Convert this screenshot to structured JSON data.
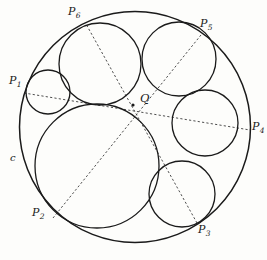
{
  "figure": {
    "background_color": "#fdfdfb",
    "stroke_color": "#1a1a1a",
    "dash_color": "#3a3a3a",
    "outer_circle": {
      "name": "c",
      "cx": 135,
      "cy": 127,
      "r": 115.5
    },
    "inner_circles": [
      {
        "name": "circle-1-small-left",
        "cx": 48,
        "cy": 92,
        "r": 22
      },
      {
        "name": "circle-2-large-bottom",
        "cx": 97,
        "cy": 166,
        "r": 62
      },
      {
        "name": "circle-3-bottom-right",
        "cx": 182,
        "cy": 194,
        "r": 33
      },
      {
        "name": "circle-4-right",
        "cx": 205,
        "cy": 123,
        "r": 33
      },
      {
        "name": "circle-5-top-right",
        "cx": 179,
        "cy": 59,
        "r": 37
      },
      {
        "name": "circle-6-top-left",
        "cx": 100,
        "cy": 64,
        "r": 41
      }
    ],
    "center_point": {
      "name": "Q",
      "x": 133,
      "y": 105,
      "dot_r": 1.6
    },
    "tangency_points": [
      {
        "name": "P1",
        "x": 24,
        "y": 93
      },
      {
        "name": "P2",
        "x": 53,
        "y": 218
      },
      {
        "name": "P3",
        "x": 197,
        "y": 223
      },
      {
        "name": "P4",
        "x": 250,
        "y": 130
      },
      {
        "name": "P5",
        "x": 201,
        "y": 35
      },
      {
        "name": "P6",
        "x": 86,
        "y": 24
      }
    ],
    "chords": [
      {
        "name": "chord-P1-P4",
        "from": "P1",
        "to": "P4"
      },
      {
        "name": "chord-P2-P5",
        "from": "P2",
        "to": "P5"
      },
      {
        "name": "chord-P3-P6",
        "from": "P3",
        "to": "P6"
      }
    ],
    "labels": {
      "p1": {
        "text": "P",
        "sub": "1",
        "x": 9,
        "y": 75
      },
      "p2": {
        "text": "P",
        "sub": "2",
        "x": 32,
        "y": 207
      },
      "p3": {
        "text": "P",
        "sub": "3",
        "x": 198,
        "y": 224
      },
      "p4": {
        "text": "P",
        "sub": "4",
        "x": 252,
        "y": 121
      },
      "p5": {
        "text": "P",
        "sub": "5",
        "x": 200,
        "y": 18
      },
      "p6": {
        "text": "P",
        "sub": "6",
        "x": 68,
        "y": 6
      },
      "q": {
        "text": "Q",
        "sub": "",
        "x": 140,
        "y": 93
      },
      "c": {
        "text": "c",
        "sub": "",
        "x": 10,
        "y": 153
      }
    }
  }
}
